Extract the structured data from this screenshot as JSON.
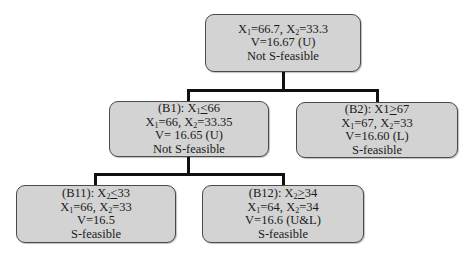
{
  "diagram": {
    "type": "branch-and-bound tree",
    "nodes": {
      "root": {
        "line1": {
          "a": "X",
          "a_sub": "1",
          "a_val": "=66.7, ",
          "b": "X",
          "b_sub": "2",
          "b_val": "=33.3"
        },
        "line2": "V=16.67 (U)",
        "line3": "Not S-feasible"
      },
      "b1": {
        "label": "(B1): ",
        "constraint_var": "X",
        "constraint_sub": "1",
        "constraint_op": "<",
        "constraint_val": "66",
        "line2": {
          "a": "X",
          "a_sub": "1",
          "a_val": "=66, ",
          "b": "X",
          "b_sub": "2",
          "b_val": "=33.35"
        },
        "line3": "V= 16.65 (U)",
        "line4": "Not S-feasible"
      },
      "b2": {
        "label": "(B2): X1",
        "constraint_op": ">",
        "constraint_val": "67",
        "line2": {
          "a": "X",
          "a_sub": "1",
          "a_val": "=67, ",
          "b": "X",
          "b_sub": "2",
          "b_val": "=33"
        },
        "line3": "V=16.60 (L)",
        "line4": "S-feasible"
      },
      "b11": {
        "label": "(B11): ",
        "constraint_var": "X",
        "constraint_sub": "2",
        "constraint_op": "<",
        "constraint_val": "33",
        "line2": {
          "a": "X",
          "a_sub": "1",
          "a_val": "=66, ",
          "b": "X",
          "b_sub": "2",
          "b_val": "=33"
        },
        "line3": "V=16.5",
        "line4": "S-feasible"
      },
      "b12": {
        "label": "(B12): ",
        "constraint_var": "X",
        "constraint_sub": "2",
        "constraint_op": ">",
        "constraint_val": "34",
        "line2": {
          "a": "X",
          "a_sub": "1",
          "a_val": "=64, ",
          "b": "X",
          "b_sub": "2",
          "b_val": "=34"
        },
        "line3": "V=16.6 (U&L)",
        "line4": "S-feasible"
      }
    },
    "edges": [
      {
        "from": "root",
        "to": "b1"
      },
      {
        "from": "root",
        "to": "b2"
      },
      {
        "from": "b1",
        "to": "b11"
      },
      {
        "from": "b1",
        "to": "b12"
      }
    ],
    "colors": {
      "node_fill": "#d3d3d3",
      "node_border": "#4a4a4a",
      "edge": "#111111"
    }
  }
}
